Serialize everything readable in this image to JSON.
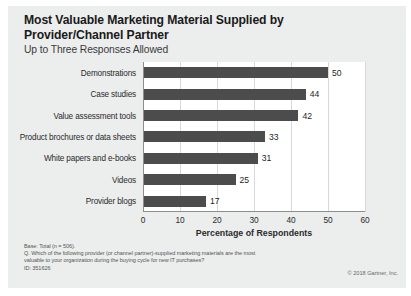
{
  "header": {
    "title": "Most Valuable Marketing Material Supplied by Provider/Channel Partner",
    "subtitle": "Up to Three Responses Allowed"
  },
  "chart_data": {
    "type": "bar",
    "orientation": "horizontal",
    "title": "Most Valuable Marketing Material Supplied by Provider/Channel Partner",
    "subtitle": "Up to Three Responses Allowed",
    "categories": [
      "Demonstrations",
      "Case studies",
      "Value assessment tools",
      "Product brochures or data sheets",
      "White papers and e-books",
      "Videos",
      "Provider blogs"
    ],
    "values": [
      50,
      44,
      42,
      33,
      31,
      25,
      17
    ],
    "xlabel": "Percentage of Respondents",
    "ylabel": "",
    "xlim": [
      0,
      60
    ],
    "xticks": [
      0,
      10,
      20,
      30,
      40,
      50,
      60
    ],
    "grid": "vertical",
    "legend": "none",
    "bar_color": "#4c4c4c",
    "plot_background": "#ffffff",
    "slide_background": "#eceded"
  },
  "footer": {
    "lines": [
      "Base: Total (n = 506).",
      "Q. Which of the following provider (or channel partner)-supplied marketing materials are the most",
      "valuable to your organization during the buying cycle for new IT purchases?",
      "ID: 351626"
    ],
    "copyright": "© 2018 Gartner, Inc."
  }
}
